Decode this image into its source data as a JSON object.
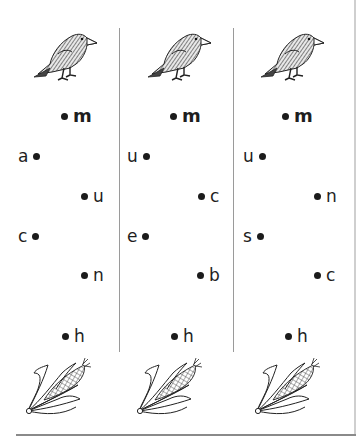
{
  "worksheet": {
    "columns": [
      {
        "start_image": "crow",
        "end_image": "corn",
        "points": [
          {
            "label": "m",
            "side": "right",
            "bold": true
          },
          {
            "label": "a",
            "side": "left"
          },
          {
            "label": "u",
            "side": "right"
          },
          {
            "label": "c",
            "side": "left"
          },
          {
            "label": "n",
            "side": "right"
          },
          {
            "label": "h",
            "side": "right"
          }
        ]
      },
      {
        "start_image": "crow",
        "end_image": "corn",
        "points": [
          {
            "label": "m",
            "side": "right",
            "bold": true
          },
          {
            "label": "u",
            "side": "left"
          },
          {
            "label": "c",
            "side": "right"
          },
          {
            "label": "e",
            "side": "left"
          },
          {
            "label": "b",
            "side": "right"
          },
          {
            "label": "h",
            "side": "right"
          }
        ]
      },
      {
        "start_image": "crow",
        "end_image": "corn",
        "points": [
          {
            "label": "m",
            "side": "right",
            "bold": true
          },
          {
            "label": "u",
            "side": "left"
          },
          {
            "label": "n",
            "side": "right"
          },
          {
            "label": "s",
            "side": "left"
          },
          {
            "label": "c",
            "side": "right"
          },
          {
            "label": "h",
            "side": "right"
          }
        ]
      }
    ]
  }
}
